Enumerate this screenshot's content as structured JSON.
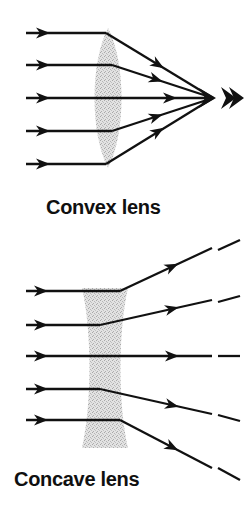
{
  "figure": {
    "background_color": "#ffffff",
    "ray_color": "#111111",
    "lens_fill_color": "#d9d9d9",
    "lens_stipple_color": "#b4b4b4",
    "canvas": {
      "width": 251,
      "height": 510
    }
  },
  "panels": [
    {
      "id": "convex",
      "caption": "Convex lens",
      "caption_x": 46,
      "caption_y": 214,
      "lens": {
        "type": "biconvex",
        "center_x": 108,
        "top_y": 28,
        "bottom_y": 168,
        "half_width": 21,
        "description": "lens-shaped (biconvex) stippled grey element"
      },
      "behavior": "converging",
      "focal_point": {
        "x": 213,
        "y": 98
      },
      "marker": {
        "name": "double-chevron-arrow",
        "x": 222,
        "y": 98,
        "label": "»"
      },
      "rays": [
        {
          "id": "convex-ray-1",
          "incoming_y": 33,
          "entry_x": 26,
          "bend_x": 106,
          "arrow_in_x": 46,
          "arrow_out_x": 158
        },
        {
          "id": "convex-ray-2",
          "incoming_y": 65,
          "entry_x": 26,
          "bend_x": 112,
          "arrow_in_x": 46,
          "arrow_out_x": 156
        },
        {
          "id": "convex-ray-3",
          "incoming_y": 98,
          "entry_x": 26,
          "bend_x": 128,
          "arrow_in_x": 46,
          "arrow_out_x": 155
        },
        {
          "id": "convex-ray-4",
          "incoming_y": 131,
          "entry_x": 26,
          "bend_x": 112,
          "arrow_in_x": 46,
          "arrow_out_x": 156
        },
        {
          "id": "convex-ray-5",
          "incoming_y": 164,
          "entry_x": 26,
          "bend_x": 106,
          "arrow_in_x": 46,
          "arrow_out_x": 158
        }
      ]
    },
    {
      "id": "concave",
      "caption": "Concave lens",
      "caption_x": 14,
      "caption_y": 486,
      "lens": {
        "type": "biconcave",
        "center_x": 105,
        "top_y": 288,
        "bottom_y": 448,
        "outer_half_width": 23,
        "waist_half_width": 9,
        "description": "hourglass-shaped (biconcave) stippled grey element"
      },
      "behavior": "diverging",
      "rays": [
        {
          "id": "concave-ray-1",
          "incoming_y": 291,
          "entry_x": 26,
          "bend_x": 120,
          "exit_y": 248,
          "arrow_in_x": 44,
          "arrow_out_x": 172,
          "dash": {
            "x1": 218,
            "y1": 250,
            "x2": 240,
            "y2": 240
          }
        },
        {
          "id": "concave-ray-2",
          "incoming_y": 325,
          "entry_x": 26,
          "bend_x": 100,
          "exit_y": 300,
          "arrow_in_x": 44,
          "arrow_out_x": 172,
          "dash": {
            "x1": 218,
            "y1": 302,
            "x2": 240,
            "y2": 296
          }
        },
        {
          "id": "concave-ray-3",
          "incoming_y": 356,
          "entry_x": 26,
          "bend_x": 105,
          "exit_y": 356,
          "arrow_in_x": 44,
          "arrow_out_x": 172,
          "dash": {
            "x1": 218,
            "y1": 356,
            "x2": 240,
            "y2": 356
          }
        },
        {
          "id": "concave-ray-4",
          "incoming_y": 389,
          "entry_x": 26,
          "bend_x": 100,
          "exit_y": 414,
          "arrow_in_x": 44,
          "arrow_out_x": 172,
          "dash": {
            "x1": 218,
            "y1": 415,
            "x2": 240,
            "y2": 421
          }
        },
        {
          "id": "concave-ray-5",
          "incoming_y": 420,
          "entry_x": 26,
          "bend_x": 120,
          "exit_y": 468,
          "arrow_in_x": 44,
          "arrow_out_x": 172,
          "dash": {
            "x1": 218,
            "y1": 468,
            "x2": 240,
            "y2": 480
          }
        }
      ]
    }
  ]
}
